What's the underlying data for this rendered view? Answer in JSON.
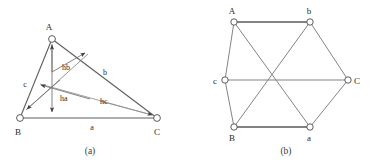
{
  "figure": {
    "background_color": "#ffffff",
    "stroke_color": "#6b6b6b",
    "bold_stroke_color": "#4a4a4a",
    "text_color": "#2b2b2b"
  },
  "panel_a": {
    "caption": "(a)",
    "vertices": [
      {
        "name": "A",
        "label": "A",
        "x": 52,
        "y": 39
      },
      {
        "name": "B",
        "label": "B",
        "x": 20,
        "y": 118
      },
      {
        "name": "C",
        "label": "C",
        "x": 157,
        "y": 118
      }
    ],
    "vertex_label_positions": [
      {
        "label": "A",
        "x": 49,
        "y": 28
      },
      {
        "label": "B",
        "x": 15,
        "y": 134
      },
      {
        "label": "C",
        "x": 153,
        "y": 134
      }
    ],
    "side_labels": [
      {
        "label": "c",
        "x": 25,
        "y": 85
      },
      {
        "label": "b",
        "x": 104,
        "y": 74
      },
      {
        "label": "a",
        "x": 91,
        "y": 129
      }
    ],
    "height_labels": [
      {
        "label": "ha",
        "x": 57,
        "y": 100
      },
      {
        "label": "hb",
        "x": 60,
        "y": 69
      },
      {
        "label": "hc",
        "x": 99,
        "y": 103
      }
    ],
    "orthocenter": {
      "x": 52,
      "y": 72
    },
    "edges": [
      {
        "name": "side-c",
        "from": "B",
        "to": "A"
      },
      {
        "name": "side-b",
        "from": "A",
        "to": "C"
      },
      {
        "name": "side-a",
        "from": "B",
        "to": "C"
      }
    ],
    "altitudes": [
      {
        "name": "ha",
        "from": "A",
        "to_base": "a",
        "direction": "down"
      },
      {
        "name": "hb",
        "from": "B",
        "to_base": "b",
        "direction": "up-right"
      },
      {
        "name": "hc",
        "from": "C",
        "to_base": "c",
        "direction": "down-left"
      }
    ]
  },
  "panel_b": {
    "caption": "(b)",
    "vertices": [
      {
        "name": "A",
        "label": "A",
        "x": 234,
        "y": 22
      },
      {
        "name": "b",
        "label": "b",
        "x": 310,
        "y": 22
      },
      {
        "name": "C",
        "label": "C",
        "x": 348,
        "y": 80
      },
      {
        "name": "a",
        "label": "a",
        "x": 310,
        "y": 127
      },
      {
        "name": "B",
        "label": "B",
        "x": 234,
        "y": 127
      },
      {
        "name": "c",
        "label": "c",
        "x": 225,
        "y": 80
      }
    ],
    "vertex_label_positions": [
      {
        "label": "A",
        "x": 231,
        "y": 13
      },
      {
        "label": "b",
        "x": 307,
        "y": 13
      },
      {
        "label": "C",
        "x": 356,
        "y": 84
      },
      {
        "label": "a",
        "x": 307,
        "y": 142
      },
      {
        "label": "B",
        "x": 231,
        "y": 142
      },
      {
        "label": "c",
        "x": 213,
        "y": 84
      }
    ],
    "edges": [
      {
        "name": "edge-A-b",
        "from": "A",
        "to": "b",
        "emphasis": "bold"
      },
      {
        "name": "edge-b-C",
        "from": "b",
        "to": "C",
        "emphasis": "normal"
      },
      {
        "name": "edge-C-a",
        "from": "C",
        "to": "a",
        "emphasis": "normal"
      },
      {
        "name": "edge-a-B",
        "from": "a",
        "to": "B",
        "emphasis": "bold"
      },
      {
        "name": "edge-B-c",
        "from": "B",
        "to": "c",
        "emphasis": "normal"
      },
      {
        "name": "edge-c-A",
        "from": "c",
        "to": "A",
        "emphasis": "normal"
      },
      {
        "name": "edge-A-a",
        "from": "A",
        "to": "a",
        "emphasis": "normal"
      },
      {
        "name": "edge-b-B",
        "from": "b",
        "to": "B",
        "emphasis": "normal"
      },
      {
        "name": "edge-c-C",
        "from": "c",
        "to": "C",
        "emphasis": "normal"
      }
    ]
  }
}
